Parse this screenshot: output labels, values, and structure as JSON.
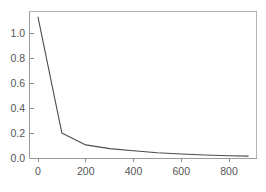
{
  "chart_data": {
    "type": "line",
    "title": "",
    "subtitle": "",
    "xlabel": "",
    "ylabel": "",
    "xlim": [
      0,
      880
    ],
    "ylim": [
      0,
      1.13
    ],
    "grid": false,
    "legend": false,
    "legend_position": "none",
    "line_color": "#4d4d4d",
    "frame_color": "#b4b4b4",
    "axis_color": "#9a9a9a",
    "tick_label_color": "#555555",
    "background_color": "#ffffff",
    "x": [
      0,
      100,
      200,
      300,
      400,
      500,
      600,
      700,
      800,
      880
    ],
    "y": [
      1.13,
      0.2,
      0.105,
      0.075,
      0.058,
      0.042,
      0.032,
      0.024,
      0.018,
      0.015
    ],
    "series": [
      {
        "name": "",
        "values": [
          1.13,
          0.2,
          0.105,
          0.075,
          0.058,
          0.042,
          0.032,
          0.024,
          0.018,
          0.015
        ]
      }
    ],
    "xticks": [
      0,
      200,
      400,
      600,
      800
    ],
    "xticklabels": [
      "0",
      "200",
      "400",
      "600",
      "800"
    ],
    "yticks": [
      0.0,
      0.2,
      0.4,
      0.6,
      0.8,
      1.0
    ],
    "yticklabels": [
      "0.0",
      "0.2",
      "0.4",
      "0.6",
      "0.8",
      "1.0"
    ],
    "annotations": []
  },
  "axes": {
    "y": {
      "labels": [
        {
          "text": "1.0",
          "value": 1.0
        },
        {
          "text": "0.8",
          "value": 0.8
        },
        {
          "text": "0.6",
          "value": 0.6
        },
        {
          "text": "0.4",
          "value": 0.4
        },
        {
          "text": "0.2",
          "value": 0.2
        },
        {
          "text": "0.0",
          "value": 0.0
        }
      ]
    },
    "x": {
      "labels": [
        {
          "text": "0",
          "value": 0
        },
        {
          "text": "200",
          "value": 200
        },
        {
          "text": "400",
          "value": 400
        },
        {
          "text": "600",
          "value": 600
        },
        {
          "text": "800",
          "value": 800
        }
      ]
    }
  }
}
